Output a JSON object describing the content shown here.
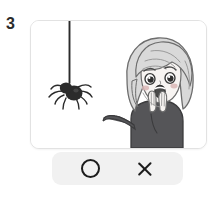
{
  "page": {
    "question_number": "3",
    "background_color": "#ffffff"
  },
  "illustration": {
    "label": "scared-girl-and-hanging-spider-illustration",
    "card_background": "#ffffff",
    "card_border_color": "#e2e2e2",
    "description": "A cartoon girl with a light gray bob haircut looks frightened, both hands raised near her open mouth, as a dark spider dangles on a thread in front of her.",
    "elements": [
      {
        "name": "spider",
        "color": "#2b2b2b",
        "description": "Dark round-bodied spider with eight thin legs hanging at the end of a silk thread."
      },
      {
        "name": "spider-thread",
        "color": "#2b2b2b",
        "description": "Thin vertical silk line from the top edge of the card down to the spider."
      },
      {
        "name": "girl-hair",
        "color": "#d9d9d9",
        "description": "Light gray shoulder-length bob hair with curved highlight strokes."
      },
      {
        "name": "girl-face",
        "color": "#f7f4f2",
        "description": "Pale face with wide worried eyes, slanted eyebrows, open oval mouth and pink blush."
      },
      {
        "name": "girl-body",
        "color": "#555558",
        "description": "Dark gray long-sleeved sweater with both arms raised toward the face."
      },
      {
        "name": "girl-hands",
        "color": "#f7f4f2",
        "description": "Two pale hands with outlined fingers held up in front of the mouth."
      }
    ]
  },
  "answer_bar": {
    "background_color": "#f1f1f1",
    "options": [
      {
        "id": "circle",
        "icon": "circle-icon",
        "label": "O",
        "meaning": "correct"
      },
      {
        "id": "cross",
        "icon": "cross-icon",
        "label": "X",
        "meaning": "incorrect"
      }
    ]
  }
}
